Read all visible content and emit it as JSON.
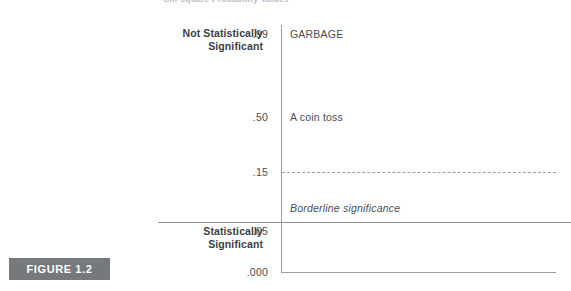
{
  "figure": {
    "top_caption": "Chi-square Probability Values",
    "badge_label": "FIGURE 1.2"
  },
  "axis": {
    "side_labels": [
      {
        "name": "not-significant",
        "line1": "Not Statistically",
        "line2": "Significant"
      },
      {
        "name": "significant",
        "line1": "Statistically",
        "line2": "Significant"
      }
    ],
    "ticks": [
      {
        "value": ".99"
      },
      {
        "value": ".50"
      },
      {
        "value": ".15"
      },
      {
        "value": ".05"
      },
      {
        "value": ".000"
      }
    ]
  },
  "annotations": [
    {
      "text": "GARBAGE",
      "at": ".99"
    },
    {
      "text": "A coin toss",
      "at": ".50"
    },
    {
      "text": "Borderline significance",
      "at": ".05"
    }
  ],
  "colors": {
    "axis_line": "#9a9ea3",
    "divider_line": "#8d9195",
    "badge_bg": "#76797c",
    "badge_text": "#ffffff",
    "label_text": "#3b3f43",
    "value_text": "#4a4e52"
  },
  "chart_data": {
    "type": "scale",
    "title": "Chi-square Probability Values",
    "ylabel": "p-value",
    "axis_orientation": "vertical",
    "ylim": [
      0.0,
      0.99
    ],
    "yticks": [
      0.99,
      0.5,
      0.15,
      0.05,
      0.0
    ],
    "ytick_labels": [
      ".99",
      ".50",
      ".15",
      ".05",
      ".000"
    ],
    "grid": false,
    "legend": "none",
    "regions": [
      {
        "label": "Not Statistically Significant",
        "from": 0.05,
        "to": 0.99
      },
      {
        "label": "Statistically Significant",
        "from": 0.0,
        "to": 0.05
      }
    ],
    "reference_lines": [
      {
        "value": 0.15,
        "style": "dashed"
      },
      {
        "value": 0.05,
        "style": "solid"
      }
    ],
    "point_annotations": [
      {
        "y": 0.99,
        "text": "GARBAGE"
      },
      {
        "y": 0.5,
        "text": "A coin toss"
      },
      {
        "y": 0.08,
        "text": "Borderline significance"
      }
    ]
  }
}
